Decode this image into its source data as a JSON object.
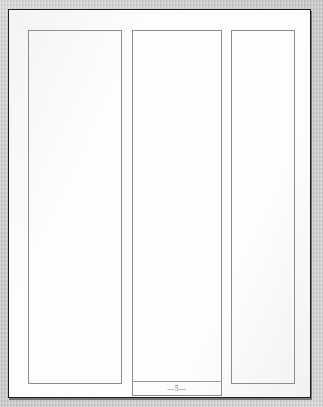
{
  "document": {
    "kind": "scanned-page",
    "orientation": "portrait",
    "page_label": "5",
    "folio_text": "—5—",
    "background_color": "#c9c9c9",
    "paper_color": "#fdfdfd",
    "border_color": "#1d1d1d",
    "rule_color": "#8e8e8e"
  },
  "layout": {
    "columns": [
      {
        "id": "left",
        "name": "column-left",
        "content": ""
      },
      {
        "id": "center",
        "name": "column-center",
        "content": ""
      },
      {
        "id": "right",
        "name": "column-right",
        "content": ""
      }
    ],
    "footer": {
      "page_number": "5",
      "ornament_left": "—",
      "ornament_right": "—"
    }
  }
}
